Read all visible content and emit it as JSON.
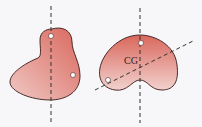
{
  "diagram": {
    "left_body": {
      "shape": "kidney",
      "suspension_points": 2,
      "plumb_lines": 1
    },
    "right_body": {
      "shape": "kidney",
      "suspension_points": 2,
      "plumb_lines": 2,
      "label": "CG"
    },
    "colors": {
      "body_fill_light": "#f0c8c4",
      "body_fill_dark": "#d9675c",
      "outline": "#4a2a2a",
      "line": "#333333",
      "background": "#f7f7f9"
    }
  }
}
